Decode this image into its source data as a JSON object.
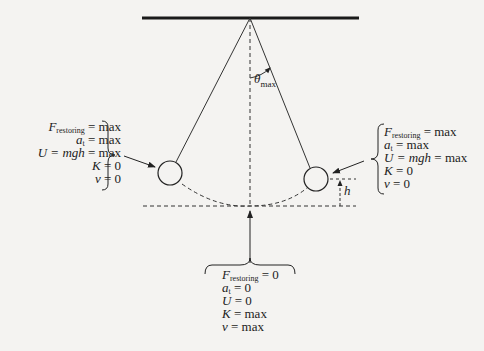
{
  "diagram": {
    "type": "pendulum-energy-diagram",
    "angle_label": {
      "symbol": "θ",
      "subscript": "max"
    },
    "height_label": "h",
    "left_extreme": {
      "lines": [
        {
          "lhs": "F",
          "sub": "restoring",
          "rhs": "= max"
        },
        {
          "lhs": "a",
          "sub": "t",
          "rhs": "= max"
        },
        {
          "lhs": "U = mgh",
          "sub": "",
          "rhs": "= max"
        },
        {
          "lhs": "K",
          "sub": "",
          "rhs": "= 0"
        },
        {
          "lhs": "v",
          "sub": "",
          "rhs": "= 0"
        }
      ]
    },
    "right_extreme": {
      "lines": [
        {
          "lhs": "F",
          "sub": "restoring",
          "rhs": "=  max"
        },
        {
          "lhs": "a",
          "sub": "t",
          "rhs": "= max"
        },
        {
          "lhs": "U = mgh",
          "sub": "",
          "rhs": "= max"
        },
        {
          "lhs": "K",
          "sub": "",
          "rhs": "= 0"
        },
        {
          "lhs": "v",
          "sub": "",
          "rhs": "= 0"
        }
      ]
    },
    "bottom_equilibrium": {
      "lines": [
        {
          "lhs": "F",
          "sub": "restoring",
          "rhs": "= 0"
        },
        {
          "lhs": "a",
          "sub": "t",
          "rhs": "= 0"
        },
        {
          "lhs": "U",
          "sub": "",
          "rhs": "= 0"
        },
        {
          "lhs": "K",
          "sub": "",
          "rhs": "= max"
        },
        {
          "lhs": "v",
          "sub": "",
          "rhs": "= max"
        }
      ]
    },
    "colors": {
      "ink": "#222222",
      "background": "#f4f3f1"
    }
  }
}
